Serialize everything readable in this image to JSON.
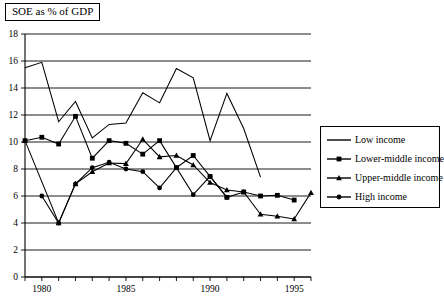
{
  "title_box": {
    "text": "SOE as % of GDP"
  },
  "legend": {
    "entries": [
      {
        "label": "Low income",
        "marker": "none"
      },
      {
        "label": "Lower-middle income",
        "marker": "square"
      },
      {
        "label": "Upper-middle income",
        "marker": "triangle"
      },
      {
        "label": "High income",
        "marker": "circle"
      }
    ]
  },
  "axis": {
    "y_ticks": [
      "0",
      "2",
      "4",
      "6",
      "8",
      "10",
      "12",
      "14",
      "16",
      "18"
    ],
    "x_ticks_labeled": [
      "1980",
      "1985",
      "1990",
      "1995"
    ]
  },
  "colors": {
    "line": "#000000",
    "gridline": "#000000",
    "background": "#ffffff"
  },
  "chart_data": {
    "type": "line",
    "title": "SOE as % of GDP",
    "xlabel": "",
    "ylabel": "",
    "xlim": [
      1979,
      1996
    ],
    "ylim": [
      0,
      18
    ],
    "ytick_step": 2,
    "xtick_step": 1,
    "xtick_labels": [
      1980,
      1985,
      1990,
      1995
    ],
    "grid": "horizontal",
    "legend_position": "right",
    "series": [
      {
        "name": "Low income",
        "marker": "none",
        "x": [
          1979,
          1980,
          1981,
          1982,
          1983,
          1984,
          1985,
          1986,
          1987,
          1988,
          1989,
          1990,
          1991,
          1992,
          1993
        ],
        "values": [
          15.5,
          15.9,
          11.5,
          13.0,
          10.3,
          11.3,
          11.4,
          13.65,
          12.9,
          15.45,
          14.75,
          10.1,
          13.6,
          11.0,
          7.4
        ]
      },
      {
        "name": "Lower-middle income",
        "marker": "square",
        "x": [
          1979,
          1980,
          1981,
          1982,
          1983,
          1984,
          1985,
          1986,
          1987,
          1988,
          1989,
          1990,
          1991,
          1992,
          1993,
          1994,
          1995
        ],
        "values": [
          10.1,
          10.35,
          9.85,
          11.9,
          8.8,
          10.1,
          9.9,
          9.1,
          10.1,
          8.1,
          9.0,
          7.45,
          5.9,
          6.3,
          6.0,
          6.05,
          5.7
        ]
      },
      {
        "name": "Upper-middle income",
        "marker": "triangle",
        "x": [
          1979,
          1981,
          1982,
          1983,
          1984,
          1985,
          1986,
          1987,
          1988,
          1989,
          1990,
          1991,
          1992,
          1993,
          1994,
          1995,
          1996
        ],
        "values": [
          10.1,
          4.0,
          6.9,
          7.8,
          8.45,
          8.4,
          10.2,
          8.9,
          9.0,
          8.3,
          7.0,
          6.45,
          6.3,
          4.65,
          4.5,
          4.3,
          6.25
        ]
      },
      {
        "name": "High income",
        "marker": "circle",
        "x": [
          1980,
          1981,
          1982,
          1983,
          1984,
          1985,
          1986,
          1987,
          1988,
          1989,
          1990,
          1991
        ],
        "values": [
          6.0,
          4.0,
          6.9,
          8.1,
          8.5,
          8.0,
          7.8,
          6.6,
          8.1,
          6.1,
          7.45,
          5.9
        ]
      }
    ]
  }
}
